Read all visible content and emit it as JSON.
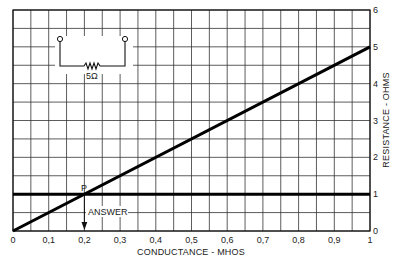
{
  "chart_data": {
    "type": "line",
    "title": "",
    "xlabel": "CONDUCTANCE - MHOS",
    "ylabel": "RESISTANCE - OHMS",
    "xlim": [
      0,
      1
    ],
    "ylim": [
      0,
      6
    ],
    "x_ticks": [
      "0",
      "0.1",
      "0.2",
      "0.3",
      "0.4",
      "0.5",
      "0.6",
      "0.7",
      "0.8",
      "0.9",
      "1"
    ],
    "y_ticks": [
      "0",
      "1",
      "2",
      "3",
      "4",
      "5",
      "6"
    ],
    "grid": true,
    "grid_x_step": 0.05,
    "grid_y_step": 0.5,
    "series": [
      {
        "name": "diagonal",
        "x": [
          0,
          1
        ],
        "y": [
          0,
          5
        ]
      },
      {
        "name": "horizontal",
        "x": [
          0,
          1
        ],
        "y": [
          1,
          1
        ]
      }
    ],
    "annotations": [
      {
        "label": "P",
        "x": 0.2,
        "y": 1
      },
      {
        "label": "ANSWER",
        "x": 0.2,
        "y": 0.5,
        "arrow_to": [
          0.2,
          0
        ]
      }
    ],
    "inset": {
      "type": "circuit",
      "resistor_label": "5Ω"
    }
  },
  "labels": {
    "point": "P",
    "answer": "ANSWER",
    "resistor": "5Ω",
    "xlabel": "CONDUCTANCE - MHOS",
    "ylabel": "RESISTANCE - OHMS"
  },
  "colors": {
    "grid": "#333333",
    "line": "#000000",
    "background": "#ffffff"
  }
}
